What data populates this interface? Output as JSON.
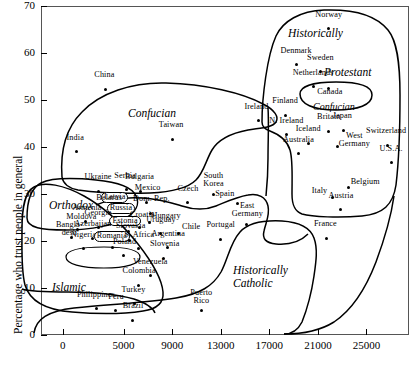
{
  "chart_data": {
    "type": "scatter",
    "title": "",
    "xlabel": "",
    "ylabel": "Percentage who trust people in general",
    "xlim": [
      -1800,
      28500
    ],
    "ylim": [
      0,
      70
    ],
    "xticks": [
      "0",
      "5000",
      "9000",
      "13000",
      "17000",
      "21000",
      "25000"
    ],
    "xtick_values": [
      0,
      5000,
      9000,
      13000,
      17000,
      21000,
      25000
    ],
    "yticks": [
      "0",
      "10",
      "20",
      "30",
      "40",
      "50",
      "60",
      "70"
    ],
    "ytick_values": [
      0,
      10,
      20,
      30,
      40,
      50,
      60,
      70
    ],
    "grid": false,
    "legend": "none",
    "points": [
      {
        "label": "China",
        "x": 3500,
        "y": 52.3,
        "lx": -1,
        "ly": 9,
        "align": "c"
      },
      {
        "label": "India",
        "x": 1100,
        "y": 39.0,
        "lx": -1,
        "ly": 9,
        "align": "c"
      },
      {
        "label": "Taiwan",
        "x": 9000,
        "y": 41.6,
        "lx": -1,
        "ly": 9,
        "align": "c"
      },
      {
        "label": "Norway",
        "x": 21900,
        "y": 65.2,
        "lx": 0,
        "ly": 9,
        "align": "c"
      },
      {
        "label": "Denmark",
        "x": 19200,
        "y": 57.5,
        "lx": 0,
        "ly": 9,
        "align": "c"
      },
      {
        "label": "Sweden",
        "x": 21200,
        "y": 56.0,
        "lx": 0,
        "ly": 9,
        "align": "c"
      },
      {
        "label": "Netherlands",
        "x": 20600,
        "y": 52.8,
        "lx": 0,
        "ly": 9,
        "align": "c"
      },
      {
        "label": "Canada",
        "x": 21900,
        "y": 52.5,
        "lx": 1,
        "ly": -9,
        "align": "c"
      },
      {
        "label": "Finland",
        "x": 18300,
        "y": 46.8,
        "lx": 0,
        "ly": 9,
        "align": "c"
      },
      {
        "label": "Ireland",
        "x": 16100,
        "y": 45.6,
        "lx": -2,
        "ly": 9,
        "align": "c"
      },
      {
        "label": "Japan",
        "x": 23100,
        "y": 43.6,
        "lx": -1,
        "ly": 9,
        "align": "c"
      },
      {
        "label": "Britain",
        "x": 21900,
        "y": 43.4,
        "lx": 0,
        "ly": 9,
        "align": "c"
      },
      {
        "label": "N. Ireland",
        "x": 18400,
        "y": 42.6,
        "lx": 0,
        "ly": 9,
        "align": "c"
      },
      {
        "label": "Iceland",
        "x": 20200,
        "y": 40.8,
        "lx": 0,
        "ly": 9,
        "align": "c"
      },
      {
        "label": "Switzerland",
        "x": 26700,
        "y": 40.4,
        "lx": -1,
        "ly": 9,
        "align": "c"
      },
      {
        "label": "West\nGermany",
        "x": 22600,
        "y": 40.2,
        "lx": 17,
        "ly": 5,
        "align": "c"
      },
      {
        "label": "Australia",
        "x": 19400,
        "y": 38.6,
        "lx": 0,
        "ly": 9,
        "align": "c"
      },
      {
        "label": "U.S.A.",
        "x": 27100,
        "y": 36.7,
        "lx": -1,
        "ly": 9,
        "align": "c"
      },
      {
        "label": "Ukraine",
        "x": 2900,
        "y": 30.6,
        "lx": 0,
        "ly": 9,
        "align": "c"
      },
      {
        "label": "Serbia",
        "x": 5200,
        "y": 30.9,
        "lx": -1,
        "ly": 9,
        "align": "c"
      },
      {
        "label": "Bulgaria",
        "x": 6400,
        "y": 30.6,
        "lx": -1,
        "ly": 9,
        "align": "c"
      },
      {
        "label": "South\nKorea",
        "x": 12400,
        "y": 30.0,
        "lx": 0,
        "ly": 13,
        "align": "c"
      },
      {
        "label": "Belgium",
        "x": 23500,
        "y": 31.3,
        "lx": 17,
        "ly": 1,
        "align": "c"
      },
      {
        "label": "Mexico",
        "x": 6900,
        "y": 28.2,
        "lx": 1,
        "ly": 9,
        "align": "c"
      },
      {
        "label": "Czech",
        "x": 10300,
        "y": 28.1,
        "lx": 0,
        "ly": 9,
        "align": "c"
      },
      {
        "label": "Italy",
        "x": 22200,
        "y": 29.2,
        "lx": -13,
        "ly": 2,
        "align": "c"
      },
      {
        "label": "Latvia",
        "x": 4700,
        "y": 26.5,
        "lx": -1,
        "ly": 9,
        "align": "c",
        "boxed": true
      },
      {
        "label": "Belarus",
        "x": 3900,
        "y": 26.2,
        "lx": -1,
        "ly": 9,
        "align": "c"
      },
      {
        "label": "Dom. Rep.",
        "x": 7200,
        "y": 25.9,
        "lx": 1,
        "ly": 9,
        "align": "c"
      },
      {
        "label": "Russia",
        "x": 5100,
        "y": 24.6,
        "lx": 0,
        "ly": 7,
        "align": "c",
        "boxed": true
      },
      {
        "label": "Austria",
        "x": 22900,
        "y": 26.6,
        "lx": 0,
        "ly": 9,
        "align": "c"
      },
      {
        "label": "Armenia",
        "x": 1900,
        "y": 24.1,
        "lx": 1,
        "ly": 9,
        "align": "c"
      },
      {
        "label": "Hungary",
        "x": 7100,
        "y": 24.0,
        "lx": 17,
        "ly": 1,
        "align": "c"
      },
      {
        "label": "Spain",
        "x": 14400,
        "y": 28.0,
        "lx": -13,
        "ly": 4,
        "align": "c"
      },
      {
        "label": "Moldova",
        "x": 1200,
        "y": 22.5,
        "lx": 4,
        "ly": 7,
        "align": "c"
      },
      {
        "label": "Georgia",
        "x": 2900,
        "y": 22.9,
        "lx": 0,
        "ly": 9,
        "align": "c"
      },
      {
        "label": "Croatia",
        "x": 6300,
        "y": 22.9,
        "lx": 3,
        "ly": 7,
        "align": "c"
      },
      {
        "label": "Estonia",
        "x": 5400,
        "y": 22.0,
        "lx": -1,
        "ly": 7,
        "align": "c",
        "boxed": true
      },
      {
        "label": "Uruguay",
        "x": 8000,
        "y": 21.6,
        "lx": 1,
        "ly": 8,
        "align": "c"
      },
      {
        "label": "Chile",
        "x": 9500,
        "y": 21.6,
        "lx": 13,
        "ly": 1,
        "align": "c"
      },
      {
        "label": "Portugal",
        "x": 13000,
        "y": 20.4,
        "lx": 0,
        "ly": 9,
        "align": "c"
      },
      {
        "label": "East\nGermany",
        "x": 15100,
        "y": 23.6,
        "lx": 1,
        "ly": 13,
        "align": "c"
      },
      {
        "label": "Bangla-\ndesh",
        "x": 700,
        "y": 20.7,
        "lx": -2,
        "ly": 8,
        "align": "c"
      },
      {
        "label": "Azerbaijan",
        "x": 2400,
        "y": 20.6,
        "lx": 1,
        "ly": 9,
        "align": "c"
      },
      {
        "label": "Slovakia",
        "x": 5500,
        "y": 20.2,
        "lx": 1,
        "ly": 9,
        "align": "c"
      },
      {
        "label": "France",
        "x": 21700,
        "y": 20.6,
        "lx": -1,
        "ly": 9,
        "align": "c"
      },
      {
        "label": "Nigeria",
        "x": 1700,
        "y": 18.4,
        "lx": 0,
        "ly": 9,
        "align": "c"
      },
      {
        "label": "Romania",
        "x": 4100,
        "y": 18.7,
        "lx": -1,
        "ly": 7,
        "align": "c",
        "boxed": true
      },
      {
        "label": "S. Africa",
        "x": 6200,
        "y": 18.5,
        "lx": 1,
        "ly": 8,
        "align": "c"
      },
      {
        "label": "Argentina",
        "x": 8600,
        "y": 18.6,
        "lx": 1,
        "ly": 9,
        "align": "c"
      },
      {
        "label": "Poland",
        "x": 5000,
        "y": 16.9,
        "lx": 1,
        "ly": 9,
        "align": "c"
      },
      {
        "label": "Slovenia",
        "x": 8300,
        "y": 16.3,
        "lx": 1,
        "ly": 9,
        "align": "c"
      },
      {
        "label": "Venezuela",
        "x": 7200,
        "y": 12.6,
        "lx": 0,
        "ly": 9,
        "align": "c"
      },
      {
        "label": "Colombia",
        "x": 6200,
        "y": 10.6,
        "lx": 1,
        "ly": 9,
        "align": "c"
      },
      {
        "label": "Turkey",
        "x": 5900,
        "y": 6.6,
        "lx": -1,
        "ly": 9,
        "align": "c"
      },
      {
        "label": "Philippines",
        "x": 2800,
        "y": 5.6,
        "lx": -1,
        "ly": 9,
        "align": "c"
      },
      {
        "label": "Peru",
        "x": 4300,
        "y": 5.2,
        "lx": 1,
        "ly": 9,
        "align": "c"
      },
      {
        "label": "Brazil",
        "x": 5700,
        "y": 3.1,
        "lx": 1,
        "ly": 9,
        "align": "c"
      },
      {
        "label": "Puerto\nRico",
        "x": 11400,
        "y": 5.2,
        "lx": 0,
        "ly": 13,
        "align": "c"
      }
    ],
    "regions": [
      {
        "name": "Confucian",
        "x": 128,
        "y": 107,
        "size": 11.5
      },
      {
        "name": "Historically",
        "x": 288,
        "y": 27,
        "size": 11.5
      },
      {
        "name": "Protestant",
        "x": 324,
        "y": 66,
        "size": 11.5
      },
      {
        "name": "Confucian",
        "x": 313,
        "y": 100,
        "size": 10
      },
      {
        "name": "Orthodox",
        "x": 49,
        "y": 199,
        "size": 11.5
      },
      {
        "name": "Islamic",
        "x": 52,
        "y": 281,
        "size": 11.5
      },
      {
        "name": "Historically\nCatholic",
        "x": 233,
        "y": 264,
        "size": 11.5
      }
    ]
  }
}
